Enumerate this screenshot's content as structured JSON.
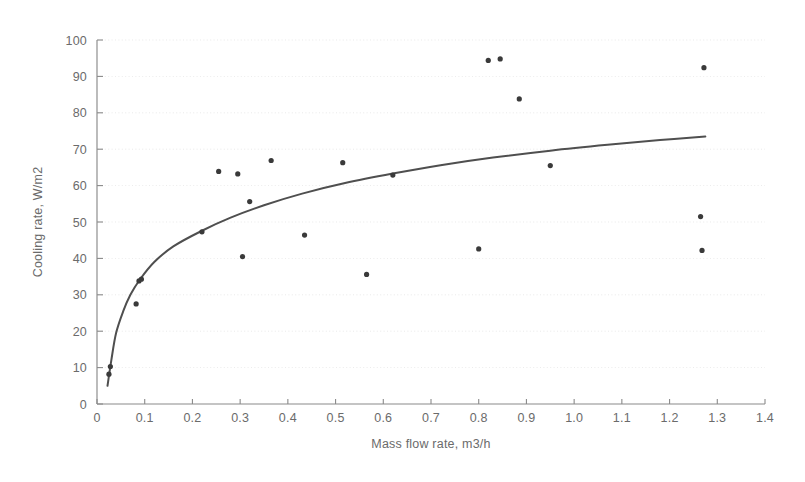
{
  "chart_data": {
    "type": "scatter",
    "title": "",
    "xlabel": "Mass flow rate, m3/h",
    "ylabel": "Cooling rate, W/m2",
    "xlim": [
      0,
      1.4
    ],
    "ylim": [
      0,
      100
    ],
    "xticks": [
      0,
      0.1,
      0.2,
      0.3,
      0.4,
      0.5,
      0.6,
      0.7,
      0.8,
      0.9,
      1.0,
      1.1,
      1.2,
      1.3,
      1.4
    ],
    "xtick_labels": [
      "0",
      "0.1",
      "0.2",
      "0.3",
      "0.4",
      "0.5",
      "0.6",
      "0.7",
      "0.8",
      "0.9",
      "1.0",
      "1.1",
      "1.2",
      "1.3",
      "1.4"
    ],
    "yticks": [
      0,
      10,
      20,
      30,
      40,
      50,
      60,
      70,
      80,
      90,
      100
    ],
    "ytick_labels": [
      "0",
      "10",
      "20",
      "30",
      "40",
      "50",
      "60",
      "70",
      "80",
      "90",
      "100"
    ],
    "grid": "faint horizontal dotted gridlines",
    "legend": null,
    "series": [
      {
        "name": "measured cooling rate",
        "type": "scatter",
        "marker": "filled circle",
        "color": "#3a3a3a",
        "points": [
          {
            "x": 0.025,
            "y": 8.2
          },
          {
            "x": 0.028,
            "y": 10.3
          },
          {
            "x": 0.082,
            "y": 27.5
          },
          {
            "x": 0.088,
            "y": 33.8
          },
          {
            "x": 0.093,
            "y": 34.3
          },
          {
            "x": 0.22,
            "y": 47.3
          },
          {
            "x": 0.255,
            "y": 63.9
          },
          {
            "x": 0.295,
            "y": 63.2
          },
          {
            "x": 0.305,
            "y": 40.5
          },
          {
            "x": 0.32,
            "y": 55.6
          },
          {
            "x": 0.365,
            "y": 66.9
          },
          {
            "x": 0.435,
            "y": 46.4
          },
          {
            "x": 0.515,
            "y": 66.3
          },
          {
            "x": 0.565,
            "y": 35.6
          },
          {
            "x": 0.62,
            "y": 62.9
          },
          {
            "x": 0.8,
            "y": 42.6
          },
          {
            "x": 0.82,
            "y": 94.4
          },
          {
            "x": 0.845,
            "y": 94.8
          },
          {
            "x": 0.885,
            "y": 83.8
          },
          {
            "x": 0.95,
            "y": 65.5
          },
          {
            "x": 1.265,
            "y": 51.5
          },
          {
            "x": 1.268,
            "y": 42.2
          },
          {
            "x": 1.272,
            "y": 92.4
          }
        ]
      },
      {
        "name": "fitted trend curve",
        "type": "line",
        "color": "#4f4f4f",
        "points": [
          {
            "x": 0.022,
            "y": 5.0
          },
          {
            "x": 0.03,
            "y": 12.0
          },
          {
            "x": 0.04,
            "y": 19.5
          },
          {
            "x": 0.055,
            "y": 25.5
          },
          {
            "x": 0.07,
            "y": 30.0
          },
          {
            "x": 0.09,
            "y": 34.2
          },
          {
            "x": 0.12,
            "y": 39.0
          },
          {
            "x": 0.16,
            "y": 43.3
          },
          {
            "x": 0.22,
            "y": 47.6
          },
          {
            "x": 0.28,
            "y": 51.2
          },
          {
            "x": 0.35,
            "y": 54.6
          },
          {
            "x": 0.43,
            "y": 57.8
          },
          {
            "x": 0.52,
            "y": 60.7
          },
          {
            "x": 0.62,
            "y": 63.3
          },
          {
            "x": 0.72,
            "y": 65.6
          },
          {
            "x": 0.83,
            "y": 67.7
          },
          {
            "x": 0.95,
            "y": 69.6
          },
          {
            "x": 1.07,
            "y": 71.2
          },
          {
            "x": 1.18,
            "y": 72.5
          },
          {
            "x": 1.275,
            "y": 73.5
          }
        ]
      }
    ]
  },
  "colors": {
    "background": "#ffffff",
    "axis": "#8a8a8a",
    "text": "#6b6b6b",
    "marker": "#3a3a3a",
    "curve": "#4f4f4f",
    "grid": "#d8d8d8"
  }
}
